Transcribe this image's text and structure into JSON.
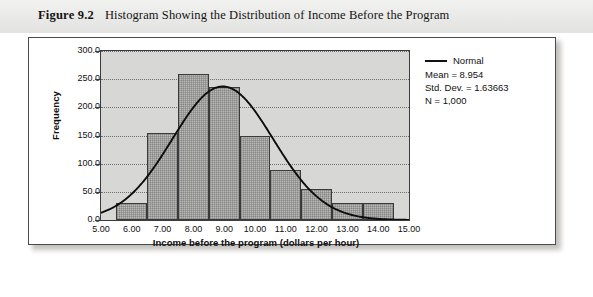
{
  "caption": {
    "figure_number": "Figure 9.2",
    "title": "Histogram Showing the Distribution of Income Before the Program"
  },
  "legend": {
    "series_label": "Normal",
    "mean": "Mean = 8.954",
    "std_dev": "Std. Dev. = 1.63663",
    "n": "N = 1,000"
  },
  "chart_data": {
    "type": "bar",
    "title": "Histogram Showing the Distribution of Income Before the Program",
    "xlabel": "Income before the program (dollars per hour)",
    "ylabel": "Frequency",
    "xlim": [
      5.0,
      15.0
    ],
    "ylim": [
      0.0,
      300.0
    ],
    "grid": true,
    "legend_position": "right",
    "x_ticks": [
      "5.00",
      "6.00",
      "7.00",
      "8.00",
      "9.00",
      "10.00",
      "11.00",
      "12.00",
      "13.00",
      "14.00",
      "15.00"
    ],
    "x_tick_values": [
      5,
      6,
      7,
      8,
      9,
      10,
      11,
      12,
      13,
      14,
      15
    ],
    "y_ticks": [
      "0.0",
      "50.0",
      "100.0",
      "150.0",
      "200.0",
      "250.0",
      "300.0"
    ],
    "y_tick_values": [
      0,
      50,
      100,
      150,
      200,
      250,
      300
    ],
    "bin_width": 1.0,
    "bin_centers": [
      6,
      7,
      8,
      9,
      10,
      11,
      12,
      13,
      14
    ],
    "bin_edges": [
      5.5,
      6.5,
      7.5,
      8.5,
      9.5,
      10.5,
      11.5,
      12.5,
      13.5,
      14.5
    ],
    "values": [
      30,
      155,
      260,
      237,
      150,
      88,
      55,
      30,
      30
    ],
    "overlay": {
      "type": "line",
      "name": "Normal",
      "mean": 8.954,
      "std_dev": 1.63663,
      "n": 1000,
      "peak_value": 237
    }
  }
}
